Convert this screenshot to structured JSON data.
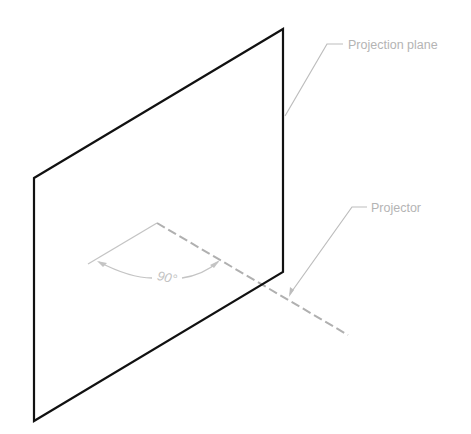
{
  "diagram": {
    "colors": {
      "plane_edge": "#111111",
      "annotation": "#bdbdbd",
      "projector_dash": "#b0b0b0",
      "label_text": "#b4b4b4",
      "background": "#ffffff"
    },
    "plane": {
      "corners": [
        [
          34,
          178
        ],
        [
          283,
          29
        ],
        [
          283,
          272
        ],
        [
          34,
          421
        ]
      ]
    },
    "projector": {
      "start": [
        157,
        223
      ],
      "end": [
        348,
        335
      ],
      "style": "dashed"
    },
    "angle": {
      "vertex": [
        157,
        223
      ],
      "reference_line_end": [
        89,
        263
      ],
      "arc_start": [
        99,
        262
      ],
      "arc_end": [
        218,
        262
      ],
      "label": "90°"
    },
    "labels": {
      "projection_plane": "Projection plane",
      "projector": "Projector"
    }
  }
}
